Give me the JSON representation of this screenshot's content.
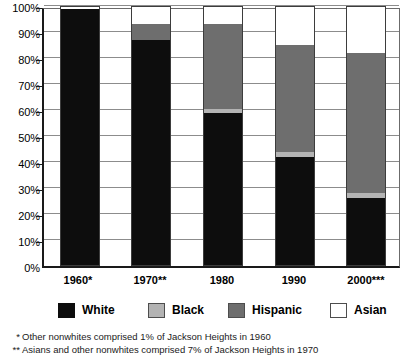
{
  "chart_data": {
    "type": "bar",
    "subtype": "stacked-bar-100-percent",
    "title": "",
    "xlabel": "",
    "ylabel": "",
    "ylim": [
      0,
      100
    ],
    "grid": true,
    "legend_position": "bottom",
    "categories": [
      "1960*",
      "1970**",
      "1980",
      "1990",
      "2000***"
    ],
    "y_tick_labels": [
      "100%",
      "90%",
      "80%",
      "70%",
      "60%",
      "50%",
      "40%",
      "30%",
      "20%",
      "10%",
      "0%"
    ],
    "y_tick_values": [
      100,
      90,
      80,
      70,
      60,
      50,
      40,
      30,
      20,
      10,
      0
    ],
    "series": [
      {
        "name": "White",
        "color": "#0d0d0d",
        "values": [
          99,
          87,
          59,
          42,
          26
        ]
      },
      {
        "name": "Black",
        "color": "#b3b3b3",
        "values": [
          0,
          0,
          1.5,
          2,
          2
        ]
      },
      {
        "name": "Hispanic",
        "color": "#6e6e6e",
        "values": [
          0,
          6,
          32.5,
          41,
          54
        ]
      },
      {
        "name": "Asian",
        "color": "#ffffff",
        "values": [
          1,
          7,
          7,
          15,
          18
        ]
      }
    ],
    "annotations": [
      "* Other nonwhites comprised 1% of Jackson Heights in 1960",
      "** Asians and other nonwhites comprised 7% of Jackson Heights in 1970"
    ]
  },
  "legend": {
    "items": [
      {
        "label": "White",
        "swatch": "legend-swatch-white"
      },
      {
        "label": "Black",
        "swatch": "legend-swatch-black"
      },
      {
        "label": "Hispanic",
        "swatch": "legend-swatch-hispanic"
      },
      {
        "label": "Asian",
        "swatch": "legend-swatch-asian"
      }
    ]
  },
  "footnotes": [
    {
      "marker": "*",
      "text": "Other nonwhites comprised 1% of Jackson Heights in 1960"
    },
    {
      "marker": "**",
      "text": "Asians and other nonwhites comprised 7% of Jackson Heights in 1970"
    }
  ]
}
